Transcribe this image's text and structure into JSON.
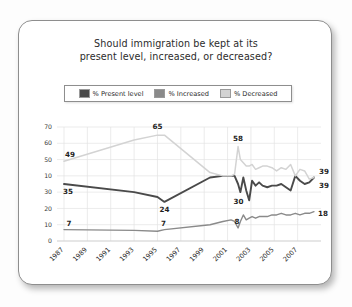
{
  "card": {
    "title_line1": "Should immigration be kept at its",
    "title_line2": "present level, increased, or decreased?"
  },
  "legend": {
    "items": [
      {
        "label": "% Present level",
        "color": "#4a4a4a"
      },
      {
        "label": "% Increased",
        "color": "#8a8a8a"
      },
      {
        "label": "% Decreased",
        "color": "#d3d3d3"
      }
    ]
  },
  "chart_data": {
    "type": "line",
    "title": "Should immigration be kept at its present level, increased, or decreased?",
    "xlabel": "",
    "ylabel": "",
    "ylim": [
      0,
      70
    ],
    "grid": true,
    "legend_position": "top",
    "ytick_labels": [
      "70",
      "60",
      "50",
      "10",
      "30",
      "20",
      "10",
      "0"
    ],
    "ytick_values": [
      70,
      60,
      50,
      40,
      30,
      20,
      10,
      0
    ],
    "xtick_labels": [
      "1987",
      "1989",
      "1991",
      "1993",
      "1995",
      "1997",
      "1999",
      "2001",
      "2003",
      "2005",
      "2007"
    ],
    "xtick_values": [
      1987,
      1989,
      1991,
      1993,
      1995,
      1997,
      1999,
      2001,
      2003,
      2005,
      2007
    ],
    "x": [
      1987,
      1993,
      1995,
      1995.6,
      1999.5,
      2000.6,
      2001.3,
      2001.6,
      2001.9,
      2002.1,
      2002.35,
      2002.6,
      2002.85,
      2003.1,
      2003.4,
      2003.7,
      2004.0,
      2004.4,
      2004.8,
      2005.2,
      2005.6,
      2006.0,
      2006.4,
      2006.8,
      2007.2,
      2007.6,
      2008.0,
      2008.4
    ],
    "series": [
      {
        "name": "% Present level",
        "color": "#4a4a4a",
        "values": [
          35,
          30,
          27,
          24,
          39,
          40,
          40,
          40,
          35,
          30,
          39,
          31,
          25,
          37,
          34,
          36,
          34,
          33,
          34,
          34,
          35,
          33,
          31,
          40,
          37,
          35,
          36,
          39
        ]
      },
      {
        "name": "% Increased",
        "color": "#8a8a8a",
        "values": [
          7,
          6.5,
          6,
          7,
          10,
          12,
          13,
          12,
          8,
          12,
          16,
          13,
          14,
          15,
          14,
          15,
          15,
          15,
          16,
          16,
          17,
          16,
          16,
          17,
          16,
          17,
          17,
          18
        ]
      },
      {
        "name": "% Decreased",
        "color": "#d3d3d3",
        "values": [
          49,
          62,
          65,
          65,
          42,
          40,
          40,
          41,
          58,
          50,
          48,
          46,
          46,
          47,
          44,
          45,
          46,
          46,
          45,
          43,
          45,
          44,
          47,
          40,
          44,
          43,
          38,
          39
        ]
      }
    ],
    "annotations": [
      {
        "text": "49",
        "series": "% Decreased",
        "x": 1987,
        "value": 49
      },
      {
        "text": "35",
        "series": "% Present level",
        "x": 1987,
        "value": 35
      },
      {
        "text": "7",
        "series": "% Increased",
        "x": 1987,
        "value": 7
      },
      {
        "text": "65",
        "series": "% Decreased",
        "x": 1995,
        "value": 65
      },
      {
        "text": "24",
        "series": "% Present level",
        "x": 1995.6,
        "value": 24
      },
      {
        "text": "7",
        "series": "% Increased",
        "x": 1995.6,
        "value": 7
      },
      {
        "text": "58",
        "series": "% Decreased",
        "x": 2001.9,
        "value": 58
      },
      {
        "text": "30",
        "series": "% Present level",
        "x": 2002.1,
        "value": 30
      },
      {
        "text": "8",
        "series": "% Increased",
        "x": 2001.9,
        "value": 8
      },
      {
        "text": "39",
        "series": "% Decreased",
        "x": 2008.4,
        "value": 39
      },
      {
        "text": "39",
        "series": "% Present level",
        "x": 2008.4,
        "value": 39
      },
      {
        "text": "18",
        "series": "% Increased",
        "x": 2008.4,
        "value": 18
      }
    ]
  }
}
